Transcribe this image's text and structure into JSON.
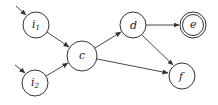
{
  "diagram": {
    "type": "directed-graph",
    "nodes": [
      {
        "id": "i1",
        "label": "i",
        "subscript": "1",
        "cx": 36,
        "cy": 25,
        "r": 13,
        "accepting": false,
        "initial": true
      },
      {
        "id": "i2",
        "label": "i",
        "subscript": "2",
        "cx": 35,
        "cy": 83,
        "r": 13,
        "accepting": false,
        "initial": true
      },
      {
        "id": "c",
        "label": "c",
        "subscript": "",
        "cx": 82,
        "cy": 56,
        "r": 15,
        "accepting": false,
        "initial": false
      },
      {
        "id": "d",
        "label": "d",
        "subscript": "",
        "cx": 133,
        "cy": 25,
        "r": 13,
        "accepting": false,
        "initial": false
      },
      {
        "id": "e",
        "label": "e",
        "subscript": "",
        "cx": 193,
        "cy": 25,
        "r": 13,
        "accepting": true,
        "initial": false
      },
      {
        "id": "f",
        "label": "f",
        "subscript": "",
        "cx": 182,
        "cy": 76,
        "r": 13,
        "accepting": false,
        "initial": false
      }
    ],
    "edges": [
      {
        "from": "i1",
        "to": "c"
      },
      {
        "from": "i2",
        "to": "c"
      },
      {
        "from": "c",
        "to": "d"
      },
      {
        "from": "c",
        "to": "f"
      },
      {
        "from": "d",
        "to": "e"
      },
      {
        "from": "d",
        "to": "f"
      }
    ],
    "colors": {
      "stroke": "#333333",
      "accepting_stroke": "#444444",
      "background": "#ffffff"
    }
  }
}
